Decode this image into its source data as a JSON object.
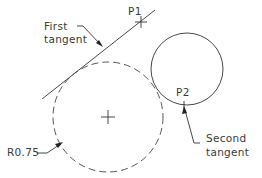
{
  "diagram": {
    "type": "cad-tangent-circle-construction",
    "labels": {
      "p1": "P1",
      "p2": "P2",
      "first_tangent": [
        "First",
        "tangent"
      ],
      "second_tangent": [
        "Second",
        "tangent"
      ],
      "radius": "R0.75"
    },
    "elements": {
      "tangent_line": "First tangent line through P1",
      "solid_circle": "Existing circle containing P2",
      "dashed_circle": "Constructed tangent circle, radius 0.75",
      "center_mark": "Center of constructed circle"
    },
    "colors": {
      "line": "#333333",
      "text": "#3a3a3a",
      "background": "#ffffff"
    }
  }
}
